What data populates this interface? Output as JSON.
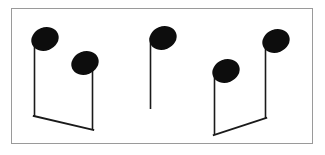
{
  "figure": {
    "title": "Musical notation figure",
    "background_color": "#ffffff",
    "ink_color": "#111111",
    "frame": {
      "name": "outer-frame",
      "stroke_color": "#9a9a9a",
      "stroke_width": 1,
      "x": 11,
      "y": 8,
      "width": 302,
      "height": 136
    }
  },
  "notation": {
    "stem_color": "#1a1a1a",
    "stem_width": 1.6,
    "beam_color": "#1a1a1a",
    "beam_width": 1.8,
    "notehead_color": "#0d0d0d",
    "notehead_rx": 14,
    "notehead_ry": 11.5,
    "notehead_rotation_deg": -22,
    "groups": [
      {
        "id": "group-1",
        "label": "beamed-pair-left",
        "beam": {
          "x1": 34.5,
          "y1": 116,
          "x2": 92.5,
          "y2": 130
        },
        "notes": [
          {
            "id": "note-1",
            "label": "note-1-high",
            "head_cx": 45,
            "head_cy": 39,
            "stem_x": 34.5,
            "stem_top": 40,
            "stem_bottom": 116
          },
          {
            "id": "note-2",
            "label": "note-2-lower",
            "head_cx": 85,
            "head_cy": 63,
            "stem_x": 92.5,
            "stem_top": 63,
            "stem_bottom": 130
          }
        ]
      },
      {
        "id": "group-2",
        "label": "single-note-middle",
        "beam": null,
        "notes": [
          {
            "id": "note-3",
            "label": "note-3-single",
            "head_cx": 163,
            "head_cy": 38,
            "stem_x": 150.5,
            "stem_top": 38,
            "stem_bottom": 109
          }
        ]
      },
      {
        "id": "group-3",
        "label": "beamed-pair-right",
        "beam": {
          "x1": 214.5,
          "y1": 135,
          "x2": 265.5,
          "y2": 118
        },
        "notes": [
          {
            "id": "note-4",
            "label": "note-4-lower",
            "head_cx": 226,
            "head_cy": 71,
            "stem_x": 214.5,
            "stem_top": 71,
            "stem_bottom": 135
          },
          {
            "id": "note-5",
            "label": "note-5-high",
            "head_cx": 276,
            "head_cy": 41,
            "stem_x": 265.5,
            "stem_top": 41,
            "stem_bottom": 118
          }
        ]
      }
    ]
  }
}
